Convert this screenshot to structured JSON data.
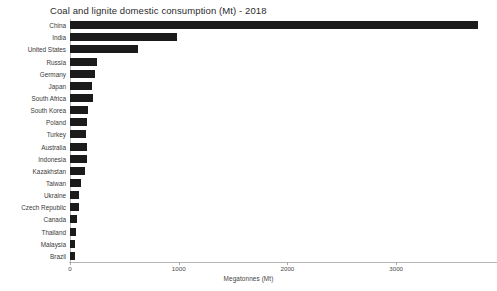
{
  "chart_data": {
    "type": "bar",
    "orientation": "horizontal",
    "title": "Coal and lignite domestic consumption (Mt) - 2018",
    "xlabel": "Megatonnes (Mt)",
    "ylabel": "",
    "xlim": [
      0,
      3900
    ],
    "xticks": [
      0,
      1000,
      2000,
      3000
    ],
    "xtick_labels": [
      "0",
      "1000",
      "2000",
      "3000"
    ],
    "grid": false,
    "legend": null,
    "bar_color": "#1b1b1b",
    "categories": [
      "China",
      "India",
      "United States",
      "Russia",
      "Germany",
      "Japan",
      "South Africa",
      "South Korea",
      "Poland",
      "Turkey",
      "Australia",
      "Indonesia",
      "Kazakhstan",
      "Taiwan",
      "Ukraine",
      "Czech Republic",
      "Canada",
      "Thailand",
      "Malaysia",
      "Brazil"
    ],
    "values": [
      3756,
      982,
      625,
      245,
      232,
      205,
      208,
      166,
      154,
      150,
      155,
      160,
      140,
      105,
      82,
      80,
      60,
      55,
      45,
      42
    ],
    "series": [
      {
        "name": "Coal and lignite domestic consumption",
        "values": [
          3756,
          982,
          625,
          245,
          232,
          205,
          208,
          166,
          154,
          150,
          155,
          160,
          140,
          105,
          82,
          80,
          60,
          55,
          45,
          42
        ]
      }
    ]
  }
}
